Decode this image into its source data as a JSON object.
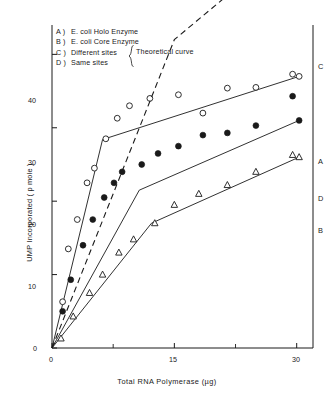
{
  "figure": {
    "xlabel": "Total RNA Polymerase (µg)",
    "ylabel": "UMP Incorporated ( p mole )",
    "theoretical_note": "Theoretical curve",
    "brace": "{"
  },
  "legend": [
    {
      "key": "A )",
      "label": "E. coli Holo Enzyme"
    },
    {
      "key": "B )",
      "label": "E. coli Core Enzyme"
    },
    {
      "key": "C )",
      "label": "Different sites"
    },
    {
      "key": "D )",
      "label": "Same sites"
    }
  ],
  "axes": {
    "x_ticks": [
      "0",
      "15",
      "30"
    ],
    "y_ticks": [
      "0",
      "10",
      "20",
      "30",
      "40"
    ]
  },
  "curve_tags": [
    "A",
    "B",
    "C",
    "D"
  ],
  "chart_data": {
    "type": "line",
    "title": "",
    "xlabel": "Total RNA Polymerase (µg)",
    "ylabel": "UMP Incorporated ( p mole )",
    "xlim": [
      0,
      32
    ],
    "ylim": [
      0,
      44
    ],
    "x_ticks": [
      0,
      15,
      30
    ],
    "x_minor_ticks": [
      7.5,
      22.5
    ],
    "y_ticks": [
      0,
      10,
      20,
      30,
      40
    ],
    "grid": false,
    "legend_position": "top-left",
    "series": [
      {
        "name": "A",
        "label": "E. coli Holo Enzyme",
        "marker": "open-circle",
        "line_style": "solid",
        "line_points": [
          [
            0,
            0
          ],
          [
            6.2,
            28.4
          ],
          [
            30.3,
            37.0
          ]
        ],
        "points": [
          [
            1.3,
            6.3
          ],
          [
            2.0,
            13.5
          ],
          [
            3.1,
            17.5
          ],
          [
            4.3,
            22.5
          ],
          [
            5.2,
            24.5
          ],
          [
            6.6,
            28.5
          ],
          [
            8.0,
            31.3
          ],
          [
            9.5,
            33.0
          ],
          [
            12.0,
            34.0
          ],
          [
            15.5,
            34.5
          ],
          [
            18.5,
            32.0
          ],
          [
            21.5,
            35.4
          ],
          [
            25.0,
            35.5
          ],
          [
            29.5,
            37.3
          ]
        ]
      },
      {
        "name": "B",
        "label": "E. coli Core Enzyme",
        "marker": "open-triangle",
        "line_style": "solid",
        "line_points": [
          [
            0,
            0
          ],
          [
            12.2,
            17.0
          ],
          [
            30.3,
            26.0
          ]
        ],
        "points": [
          [
            1.1,
            1.3
          ],
          [
            2.6,
            4.3
          ],
          [
            4.6,
            7.5
          ],
          [
            6.2,
            10.0
          ],
          [
            8.2,
            13.0
          ],
          [
            10.0,
            14.8
          ],
          [
            12.6,
            17.0
          ],
          [
            15.0,
            19.5
          ],
          [
            18.0,
            21.0
          ],
          [
            21.5,
            22.2
          ],
          [
            25.0,
            24.0
          ],
          [
            29.5,
            26.3
          ]
        ]
      },
      {
        "name": "C",
        "label": "Different sites",
        "marker": "none",
        "line_style": "dashed",
        "line_points": [
          [
            0,
            0
          ],
          [
            15.0,
            42.0
          ],
          [
            22.0,
            48.5
          ],
          [
            27.5,
            51.0
          ],
          [
            30.5,
            51.3
          ]
        ]
      },
      {
        "name": "D",
        "label": "Same sites",
        "marker": "filled-circle",
        "line_style": "solid",
        "line_points": [
          [
            0,
            0
          ],
          [
            10.7,
            21.5
          ],
          [
            30.3,
            31.0
          ]
        ],
        "points": [
          [
            1.3,
            5.0
          ],
          [
            2.3,
            9.3
          ],
          [
            3.8,
            14.0
          ],
          [
            5.0,
            17.5
          ],
          [
            6.4,
            20.5
          ],
          [
            7.6,
            22.5
          ],
          [
            8.6,
            24.0
          ],
          [
            11.0,
            25.0
          ],
          [
            13.0,
            26.5
          ],
          [
            15.5,
            27.5
          ],
          [
            18.5,
            29.0
          ],
          [
            21.5,
            29.3
          ],
          [
            25.0,
            30.3
          ],
          [
            29.5,
            34.3
          ]
        ]
      }
    ]
  }
}
